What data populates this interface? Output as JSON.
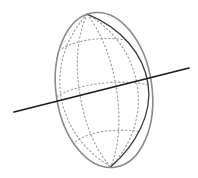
{
  "figure": {
    "type": "geometric-diagram",
    "canvas": {
      "width": 198,
      "height": 178,
      "background": "#ffffff"
    },
    "colors": {
      "disk_rim": "#8a8a8a",
      "sphere_limb": "#3a3a3a",
      "grid_dotted": "#9a9a9a",
      "axis_line": "#1a1a1a",
      "background": "#ffffff"
    },
    "ellipse": {
      "label": "disk-rim-ellipse",
      "center_x": 104,
      "center_y": 90,
      "radius_x": 48,
      "radius_y": 78,
      "rotation_deg": -8,
      "stroke_width": 1.6
    },
    "sphere_limb": {
      "label": "sphere-limb-arc",
      "pole_top_x": 98,
      "pole_top_y": 13,
      "pole_bottom_x": 100,
      "pole_bottom_y": 167,
      "bulge_x": 148,
      "stroke_width": 1.3
    },
    "grid": {
      "meridian_count": 4,
      "parallel_count": 3,
      "dash_pattern": "1.4 2.6",
      "stroke_width": 1.1
    },
    "axis_line": {
      "label": "secant-axis-line",
      "x1": 14,
      "y1": 112,
      "x2": 189,
      "y2": 68,
      "stroke_width": 1.7
    }
  }
}
